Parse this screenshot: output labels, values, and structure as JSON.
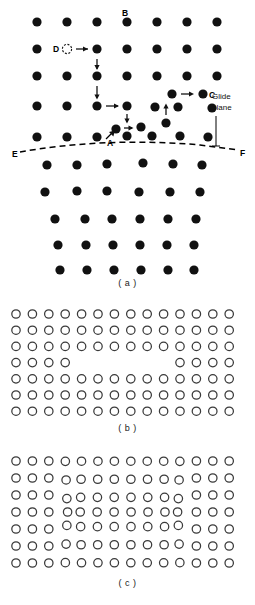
{
  "figure": {
    "background_color": "#ffffff",
    "atom_filled_color": "#111111",
    "atom_open_stroke_color": "#3a3a3a"
  },
  "captions": {
    "a": "( a )",
    "b": "( b )",
    "c": "( c )"
  },
  "panel_a": {
    "name": "filled-atom-lattice-with-dislocation",
    "labels": {
      "A": "A",
      "B": "B",
      "C": "C",
      "D": "D",
      "E": "E",
      "F": "F",
      "glide_plane": "Glide\nplane",
      "glide_plane_line1": "Glide",
      "glide_plane_line2": "plane"
    },
    "atom_style": "filled",
    "atom_radius": 4.6,
    "glide_plane_style": "dashed",
    "upper_rows": [
      {
        "y": 22,
        "xs": [
          37,
          67,
          97,
          127,
          157,
          187,
          217
        ]
      },
      {
        "y": 49,
        "xs": [
          37,
          97,
          127,
          157,
          187,
          217
        ]
      },
      {
        "y": 76,
        "xs": [
          37,
          67,
          97,
          127,
          157,
          187,
          217
        ]
      },
      {
        "y": 106,
        "xs": [
          37,
          67,
          97,
          127,
          157,
          172,
          187,
          210
        ]
      },
      {
        "y": 128,
        "xs": [
          112,
          142,
          166
        ]
      },
      {
        "y": 134,
        "xs": [
          37,
          67,
          97,
          127,
          157,
          187,
          211
        ]
      }
    ],
    "lower_rows": [
      {
        "y": 163,
        "xs": [
          41,
          71,
          101,
          131,
          161,
          191
        ]
      },
      {
        "y": 190,
        "xs": [
          41,
          71,
          101,
          131,
          161,
          191
        ]
      },
      {
        "y": 217,
        "xs": [
          41,
          71,
          101,
          131,
          161,
          191
        ]
      },
      {
        "y": 244,
        "xs": [
          41,
          71,
          101,
          131,
          161,
          191
        ]
      },
      {
        "y": 268,
        "xs": [
          41,
          71,
          101,
          131,
          161,
          191
        ]
      }
    ],
    "vacancy": {
      "x": 67,
      "y": 49,
      "r": 4.6,
      "style": "dashed-open"
    },
    "arrows": [
      {
        "name": "arrow-D-right",
        "x1": 76,
        "y1": 49,
        "x2": 90,
        "y2": 49
      },
      {
        "name": "arrow-down-1",
        "x1": 97,
        "y1": 58,
        "x2": 97,
        "y2": 70
      },
      {
        "name": "arrow-down-2",
        "x1": 97,
        "y1": 85,
        "x2": 97,
        "y2": 99
      },
      {
        "name": "arrow-right-2",
        "x1": 106,
        "y1": 106,
        "x2": 120,
        "y2": 106
      },
      {
        "name": "arrow-down-3",
        "x1": 127,
        "y1": 113,
        "x2": 127,
        "y2": 124
      },
      {
        "name": "arrow-right-3",
        "x1": 121,
        "y1": 128,
        "x2": 135,
        "y2": 128
      },
      {
        "name": "arrow-up-4",
        "x1": 166,
        "y1": 113,
        "x2": 166,
        "y2": 104
      },
      {
        "name": "arrow-right-C",
        "x1": 181,
        "y1": 94,
        "x2": 194,
        "y2": 94
      },
      {
        "name": "arrow-A-to-cell",
        "x1": 107,
        "y1": 138,
        "x2": 118,
        "y2": 129
      }
    ],
    "glide_plane_path": "M 10,153 C 60,144 130,140 200,146 L 245,151",
    "glide_plane_endpoints": {
      "E": {
        "x": 14,
        "y": 152
      },
      "F": {
        "x": 243,
        "y": 152
      }
    }
  },
  "panel_b": {
    "name": "open-circle-lattice-with-vacancy-row",
    "atom_style": "open",
    "atom_radius": 4.2,
    "columns": 14,
    "rows": 7,
    "vacancy_row_index": 3,
    "vacancy_row_left_count": 4,
    "vacancy_row_right_count": 4,
    "description": "Perfect open-circle lattice with a missing half-row of atoms in the fourth row (edge dislocation extra half-plane removed)"
  },
  "panel_c": {
    "name": "open-circle-lattice-with-edge-dislocation",
    "atom_style": "open",
    "atom_radius": 4.2,
    "columns": 14,
    "rows": 7,
    "description": "Same lattice after closure, showing lattice distortion around the edge dislocation core"
  }
}
